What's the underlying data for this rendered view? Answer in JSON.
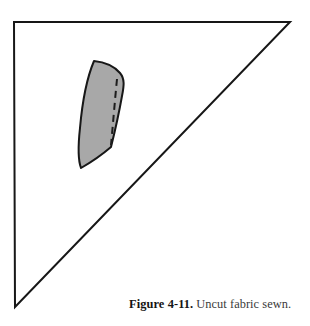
{
  "figure": {
    "caption_label": "Figure 4-11.",
    "caption_text": "Uncut fabric sewn.",
    "background_color": "#ffffff",
    "line_color": "#171717",
    "fabric_fill_color": "#a8a8a8",
    "fabric_outline_color": "#171717",
    "stitch_line_color": "#1c1c1c",
    "triangle": {
      "name": "right-triangle-fabric-outline",
      "vertices": [
        [
          14,
          22
        ],
        [
          290,
          22
        ],
        [
          15,
          307
        ]
      ],
      "stroke_width": 2
    },
    "fabric_piece": {
      "name": "uncut-fabric-piece",
      "outline_points": [
        [
          94,
          61
        ],
        [
          108,
          65
        ],
        [
          118,
          71
        ],
        [
          124,
          82
        ],
        [
          120,
          104
        ],
        [
          114,
          128
        ],
        [
          110,
          146
        ],
        [
          92,
          160
        ],
        [
          80,
          168
        ],
        [
          78,
          159
        ],
        [
          80,
          130
        ],
        [
          84,
          100
        ],
        [
          88,
          78
        ]
      ],
      "stroke_width": 2
    },
    "stitch_line": {
      "name": "dashed-stitch-line",
      "points": [
        [
          117,
          80
        ],
        [
          114,
          110
        ],
        [
          111,
          146
        ]
      ],
      "dash_pattern": "7 5",
      "stroke_width": 2
    }
  }
}
